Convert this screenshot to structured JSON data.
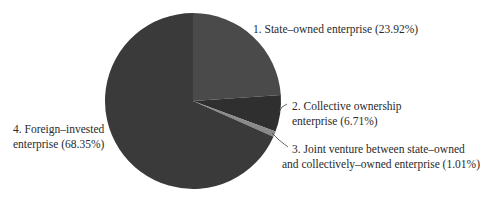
{
  "chart_data": {
    "type": "pie",
    "title": "",
    "start_angle": "12 o'clock, clockwise",
    "slices": [
      {
        "index": 1,
        "label": "State-owned enterprise",
        "value": 23.92,
        "color": "#4a4a4a"
      },
      {
        "index": 2,
        "label": "Collective ownership enterprise",
        "value": 6.71,
        "color": "#2f2f2f"
      },
      {
        "index": 3,
        "label": "Joint venture between state-owned and collectively-owned enterprise",
        "value": 1.01,
        "color": "#8a8a8a"
      },
      {
        "index": 4,
        "label": "Foreign-invested enterprise",
        "value": 68.35,
        "color": "#3a3a3a"
      }
    ],
    "categories": [
      "State-owned enterprise",
      "Collective ownership enterprise",
      "Joint venture between state-owned and collectively-owned enterprise",
      "Foreign-invested enterprise"
    ],
    "values": [
      23.92,
      6.71,
      1.01,
      68.35
    ],
    "legend_position": "callout labels"
  },
  "labels": {
    "slice1": {
      "line1": "1. State–owned enterprise (23.92%)"
    },
    "slice2": {
      "line1": "2. Collective ownership",
      "line2": "enterprise (6.71%)"
    },
    "slice3": {
      "line1": "3. Joint venture between state–owned",
      "line2": "and collectively–owned enterprise (1.01%)"
    },
    "slice4": {
      "line1": "4. Foreign–invested",
      "line2": "enterprise (68.35%)"
    }
  }
}
